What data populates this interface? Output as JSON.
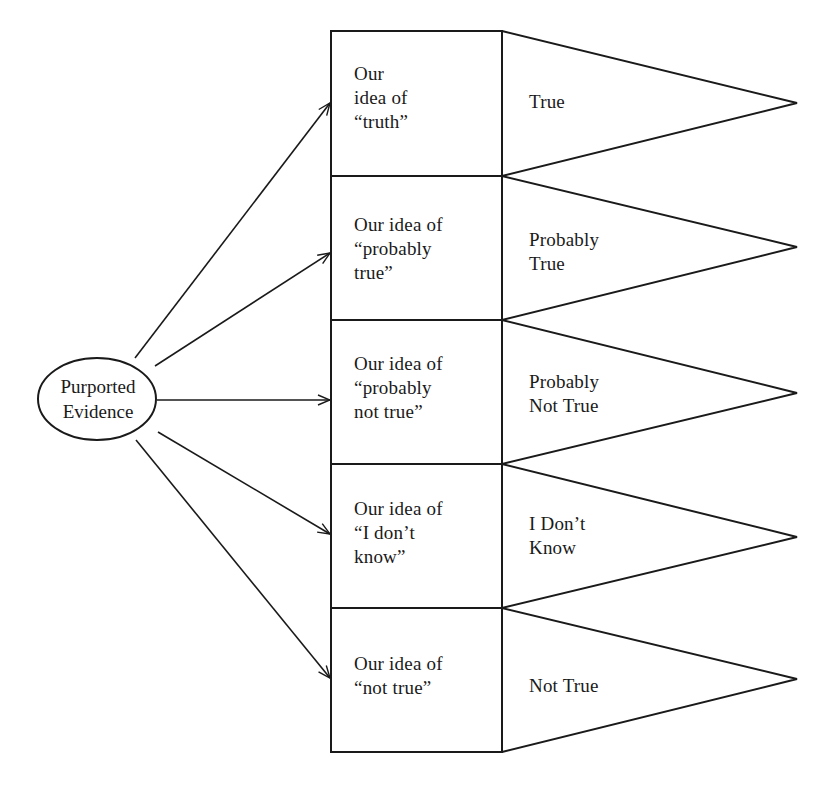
{
  "diagram": {
    "source": {
      "label_line1": "Purported",
      "label_line2": "Evidence",
      "shape": "ellipse"
    },
    "rows": [
      {
        "idea_lines": [
          "Our",
          "idea of",
          "“truth”"
        ],
        "outcome_lines": [
          "True"
        ]
      },
      {
        "idea_lines": [
          "Our idea of",
          "“probably",
          "true”"
        ],
        "outcome_lines": [
          "Probably",
          "True"
        ]
      },
      {
        "idea_lines": [
          "Our idea of",
          "“probably",
          "not true”"
        ],
        "outcome_lines": [
          "Probably",
          "Not True"
        ]
      },
      {
        "idea_lines": [
          "Our idea of",
          "“I don’t",
          "know”"
        ],
        "outcome_lines": [
          "I Don’t",
          "Know"
        ]
      },
      {
        "idea_lines": [
          "Our idea of",
          "“not true”"
        ],
        "outcome_lines": [
          "Not True"
        ]
      }
    ],
    "colors": {
      "stroke": "#1a1a1a",
      "background": "#ffffff"
    }
  }
}
